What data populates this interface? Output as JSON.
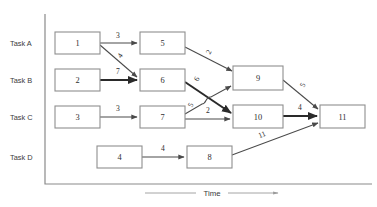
{
  "diagram": {
    "axis": {
      "vertical_x": 45,
      "vertical_y_top": 14,
      "vertical_y_bottom": 184,
      "horizontal_x_end": 372,
      "color": "#8a8a8a"
    },
    "time_axis": {
      "label": "Time",
      "arrow": "right-arrow-icon",
      "left_line": {
        "x1": 145,
        "x2": 196,
        "y": 193
      },
      "right_line": {
        "x1": 228,
        "x2": 278,
        "y": 193
      },
      "label_x": 212,
      "label_y": 196
    },
    "rows": [
      {
        "id": "task-a",
        "label": "Task A",
        "y": 43
      },
      {
        "id": "task-b",
        "label": "Task B",
        "y": 80
      },
      {
        "id": "task-c",
        "label": "Task C",
        "y": 117
      },
      {
        "id": "task-d",
        "label": "Task D",
        "y": 157
      }
    ],
    "row_label_x": 10,
    "nodes": [
      {
        "id": "n1",
        "label": "1",
        "x": 55,
        "y": 32,
        "w": 45,
        "h": 22,
        "row": "task-a"
      },
      {
        "id": "n5",
        "label": "5",
        "x": 140,
        "y": 32,
        "w": 45,
        "h": 22,
        "row": "task-a"
      },
      {
        "id": "n2",
        "label": "2",
        "x": 55,
        "y": 69,
        "w": 45,
        "h": 22,
        "row": "task-b"
      },
      {
        "id": "n6",
        "label": "6",
        "x": 140,
        "y": 69,
        "w": 45,
        "h": 22,
        "row": "task-b"
      },
      {
        "id": "n9",
        "label": "9",
        "x": 233,
        "y": 66,
        "w": 50,
        "h": 24,
        "row": "task-b"
      },
      {
        "id": "n3",
        "label": "3",
        "x": 55,
        "y": 106,
        "w": 45,
        "h": 22,
        "row": "task-c"
      },
      {
        "id": "n7",
        "label": "7",
        "x": 140,
        "y": 106,
        "w": 45,
        "h": 22,
        "row": "task-c"
      },
      {
        "id": "n10",
        "label": "10",
        "x": 233,
        "y": 105,
        "w": 50,
        "h": 23,
        "row": "task-c"
      },
      {
        "id": "n11",
        "label": "11",
        "x": 320,
        "y": 105,
        "w": 45,
        "h": 23,
        "row": "task-c"
      },
      {
        "id": "n4",
        "label": "4",
        "x": 97,
        "y": 146,
        "w": 45,
        "h": 22,
        "row": "task-d"
      },
      {
        "id": "n8",
        "label": "8",
        "x": 187,
        "y": 146,
        "w": 45,
        "h": 22,
        "row": "task-d"
      }
    ],
    "edges": [
      {
        "id": "e1-5",
        "from": "n1",
        "to": "n5",
        "weight": "3",
        "bold": false,
        "x1": 100,
        "y1": 43,
        "x2": 137,
        "y2": 43,
        "lx": 118,
        "ly": 38,
        "rot": 0
      },
      {
        "id": "e1-6",
        "from": "n1",
        "to": "n6",
        "weight": "4",
        "bold": false,
        "x1": 100,
        "y1": 45,
        "x2": 137,
        "y2": 77,
        "lx": 122,
        "ly": 57,
        "rot": -55
      },
      {
        "id": "e2-6",
        "from": "n2",
        "to": "n6",
        "weight": "7",
        "bold": true,
        "x1": 100,
        "y1": 80,
        "x2": 137,
        "y2": 80,
        "lx": 118,
        "ly": 74,
        "rot": 0
      },
      {
        "id": "e3-7",
        "from": "n3",
        "to": "n7",
        "weight": "3",
        "bold": false,
        "x1": 100,
        "y1": 117,
        "x2": 137,
        "y2": 117,
        "lx": 118,
        "ly": 111,
        "rot": 0
      },
      {
        "id": "e4-8",
        "from": "n4",
        "to": "n8",
        "weight": "4",
        "bold": false,
        "x1": 142,
        "y1": 157,
        "x2": 184,
        "y2": 157,
        "lx": 163,
        "ly": 151,
        "rot": 0
      },
      {
        "id": "e5-9",
        "from": "n5",
        "to": "n9",
        "weight": "2",
        "bold": false,
        "x1": 185,
        "y1": 47,
        "x2": 232,
        "y2": 71,
        "lx": 211,
        "ly": 53,
        "rot": -62
      },
      {
        "id": "e6-10",
        "from": "n6",
        "to": "n10",
        "weight": "6",
        "bold": true,
        "x1": 185,
        "y1": 82,
        "x2": 231,
        "y2": 113,
        "lx": 199,
        "ly": 80,
        "rot": -62
      },
      {
        "id": "e7-9",
        "from": "n7",
        "to": "n9",
        "weight": "5",
        "bold": false,
        "x1": 185,
        "y1": 114,
        "x2": 231,
        "y2": 86,
        "lx": 193,
        "ly": 106,
        "rot": -62
      },
      {
        "id": "e7-10",
        "from": "n7",
        "to": "n10",
        "weight": "2",
        "bold": false,
        "x1": 185,
        "y1": 119,
        "x2": 230,
        "y2": 119,
        "lx": 208,
        "ly": 113,
        "rot": 0
      },
      {
        "id": "e9-11",
        "from": "n9",
        "to": "n11",
        "weight": "5",
        "bold": false,
        "x1": 283,
        "y1": 80,
        "x2": 318,
        "y2": 109,
        "lx": 305,
        "ly": 86,
        "rot": -62
      },
      {
        "id": "e10-11",
        "from": "n10",
        "to": "n11",
        "weight": "4",
        "bold": true,
        "x1": 283,
        "y1": 116,
        "x2": 317,
        "y2": 116,
        "lx": 300,
        "ly": 110,
        "rot": 0
      },
      {
        "id": "e8-11",
        "from": "n8",
        "to": "n11",
        "weight": "11",
        "bold": false,
        "x1": 232,
        "y1": 155,
        "x2": 318,
        "y2": 123,
        "lx": 263,
        "ly": 137,
        "rot": -22
      }
    ]
  }
}
